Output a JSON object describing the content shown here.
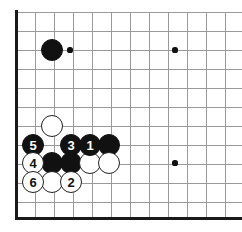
{
  "diagram": {
    "board": {
      "type": "go-board",
      "visible_columns": 12,
      "visible_rows": 11,
      "grid_spacing_px": 19,
      "origin_x_px": 16,
      "origin_y_px": 12,
      "edge_left": true,
      "edge_bottom": true,
      "edge_top": false,
      "edge_right": false,
      "line_color": "#9a9a9a",
      "edge_color": "#1a1a1a",
      "background_color": "#ffffff",
      "black_color": "#111111",
      "white_color": "#ffffff"
    },
    "star_points": [
      {
        "name": "star-point-1",
        "cx": 70,
        "cy": 50
      },
      {
        "name": "star-point-2",
        "cx": 175,
        "cy": 50
      },
      {
        "name": "star-point-3",
        "cx": 175,
        "cy": 163
      }
    ],
    "stones": [
      {
        "name": "stone-black-hoshi",
        "color": "black",
        "label": "",
        "cx": 52,
        "cy": 50,
        "r": 11
      },
      {
        "name": "stone-white-upper",
        "color": "white",
        "label": "",
        "cx": 52,
        "cy": 126,
        "r": 11
      },
      {
        "name": "stone-black-move-5",
        "color": "black",
        "label": "5",
        "cx": 33,
        "cy": 145,
        "r": 11
      },
      {
        "name": "stone-black-move-3",
        "color": "black",
        "label": "3",
        "cx": 71,
        "cy": 145,
        "r": 11
      },
      {
        "name": "stone-black-move-1",
        "color": "black",
        "label": "1",
        "cx": 90,
        "cy": 145,
        "r": 11
      },
      {
        "name": "stone-black-right",
        "color": "black",
        "label": "",
        "cx": 109,
        "cy": 145,
        "r": 11
      },
      {
        "name": "stone-white-move-4",
        "color": "white",
        "label": "4",
        "cx": 33,
        "cy": 163,
        "r": 11
      },
      {
        "name": "stone-black-mid-left",
        "color": "black",
        "label": "",
        "cx": 52,
        "cy": 163,
        "r": 11
      },
      {
        "name": "stone-black-mid-right",
        "color": "black",
        "label": "",
        "cx": 71,
        "cy": 163,
        "r": 11
      },
      {
        "name": "stone-white-mid-a",
        "color": "white",
        "label": "",
        "cx": 90,
        "cy": 163,
        "r": 11
      },
      {
        "name": "stone-white-mid-b",
        "color": "white",
        "label": "",
        "cx": 109,
        "cy": 163,
        "r": 11
      },
      {
        "name": "stone-white-move-6",
        "color": "white",
        "label": "6",
        "cx": 33,
        "cy": 182,
        "r": 11
      },
      {
        "name": "stone-white-bottom",
        "color": "white",
        "label": "",
        "cx": 52,
        "cy": 182,
        "r": 11
      },
      {
        "name": "stone-white-move-2",
        "color": "white",
        "label": "2",
        "cx": 71,
        "cy": 182,
        "r": 11
      }
    ],
    "move_sequence": [
      {
        "move": "1",
        "color": "black"
      },
      {
        "move": "2",
        "color": "white"
      },
      {
        "move": "3",
        "color": "black"
      },
      {
        "move": "4",
        "color": "white"
      },
      {
        "move": "5",
        "color": "black"
      },
      {
        "move": "6",
        "color": "white"
      }
    ]
  }
}
